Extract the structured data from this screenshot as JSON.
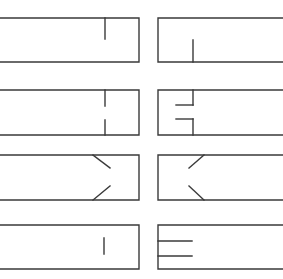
{
  "diagram": {
    "stroke_color": "#3a3a3a",
    "background": "#ffffff",
    "rows": [
      {
        "top": 18,
        "bottom": 62,
        "left": {
          "name": "row1-left",
          "marks": [
            [
              105,
              18,
              105,
              39
            ]
          ]
        },
        "right": {
          "name": "row1-right",
          "marks": [
            [
              193,
              40,
              193,
              62
            ]
          ]
        }
      },
      {
        "top": 90,
        "bottom": 135,
        "left": {
          "name": "row2-left",
          "marks": [
            [
              105,
              90,
              105,
              106
            ],
            [
              105,
              120,
              105,
              135
            ]
          ]
        },
        "right": {
          "name": "row2-right",
          "marks": [
            [
              193,
              90,
              193,
              105
            ],
            [
              176,
              105,
              193,
              105
            ],
            [
              176,
              119,
              193,
              119
            ],
            [
              193,
              119,
              193,
              135
            ]
          ]
        }
      },
      {
        "top": 155,
        "bottom": 200,
        "left": {
          "name": "row3-left",
          "marks": [
            [
              93,
              155,
              110,
              168
            ],
            [
              110,
              186,
              93,
              200
            ]
          ]
        },
        "right": {
          "name": "row3-right",
          "marks": [
            [
              204,
              155,
              189,
              168
            ],
            [
              189,
              186,
              204,
              200
            ]
          ]
        }
      },
      {
        "top": 225,
        "bottom": 269,
        "left": {
          "name": "row4-left",
          "marks": [
            [
              104,
              238,
              104,
              254
            ]
          ]
        },
        "right": {
          "name": "row4-right",
          "marks": [
            [
              158,
              241,
              192,
              241
            ],
            [
              158,
              256,
              192,
              256
            ]
          ]
        }
      }
    ],
    "left_box": {
      "x_start": 0,
      "x_end": 139
    },
    "right_box": {
      "x_start": 158,
      "x_end": 283
    }
  }
}
